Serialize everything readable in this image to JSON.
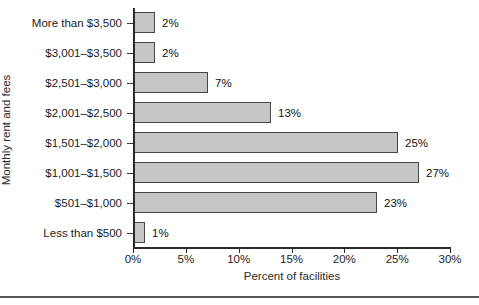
{
  "chart_data": {
    "type": "bar",
    "orientation": "horizontal",
    "title": "",
    "categories": [
      "More than $3,500",
      "$3,001–$3,500",
      "$2,501–$3,000",
      "$2,001–$2,500",
      "$1,501–$2,000",
      "$1,001–$1,500",
      "$501–$1,000",
      "Less than $500"
    ],
    "values": [
      2,
      2,
      7,
      13,
      25,
      27,
      23,
      1
    ],
    "value_labels": [
      "2%",
      "2%",
      "7%",
      "13%",
      "25%",
      "27%",
      "23%",
      "1%"
    ],
    "xlabel": "Percent of facilities",
    "ylabel": "Monthly rent and fees",
    "xlim": [
      0,
      30
    ],
    "xticks": [
      0,
      5,
      10,
      15,
      20,
      25,
      30
    ],
    "xtick_labels": [
      "0%",
      "5%",
      "10%",
      "15%",
      "20%",
      "25%",
      "30%"
    ],
    "grid": false,
    "legend": null,
    "colors": {
      "bar_fill": "#c5c6c7",
      "bar_border": "#474747",
      "axis": "#2a2a2a",
      "text": "#1c1c1c",
      "bottom_rule": "#565656",
      "background": "#ffffff"
    }
  }
}
